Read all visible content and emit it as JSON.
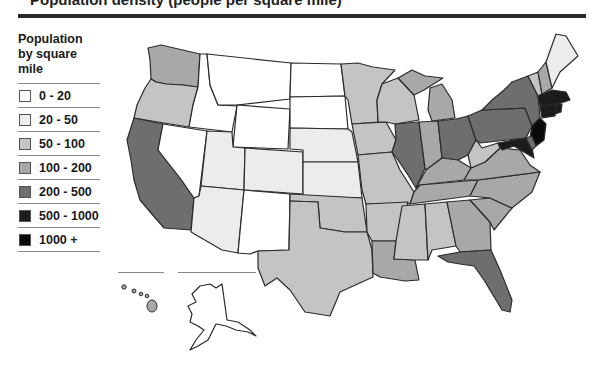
{
  "title_partial": "Population density (people per square mile)",
  "legend": {
    "title": "Population by square mile",
    "items": [
      {
        "label": "0 - 20",
        "color": "#ffffff"
      },
      {
        "label": "20 - 50",
        "color": "#ececec"
      },
      {
        "label": "50 - 100",
        "color": "#c4c4c4"
      },
      {
        "label": "100 - 200",
        "color": "#a8a8a8"
      },
      {
        "label": "200 - 500",
        "color": "#6e6e6e"
      },
      {
        "label": "500 - 1000",
        "color": "#1c1c1c"
      },
      {
        "label": "1000 +",
        "color": "#0a0a0a"
      }
    ]
  },
  "map": {
    "region": "United States",
    "insets": [
      "Hawaii",
      "Alaska"
    ],
    "states": {
      "WA": "100 - 200",
      "OR": "50 - 100",
      "CA": "200 - 500",
      "ID": "0 - 20",
      "NV": "0 - 20",
      "MT": "0 - 20",
      "WY": "0 - 20",
      "UT": "20 - 50",
      "CO": "20 - 50",
      "AZ": "20 - 50",
      "NM": "0 - 20",
      "ND": "0 - 20",
      "SD": "0 - 20",
      "NE": "20 - 50",
      "KS": "20 - 50",
      "OK": "50 - 100",
      "TX": "50 - 100",
      "MN": "50 - 100",
      "IA": "50 - 100",
      "MO": "50 - 100",
      "AR": "50 - 100",
      "LA": "100 - 200",
      "WI": "50 - 100",
      "IL": "200 - 500",
      "MI": "100 - 200",
      "IN": "100 - 200",
      "OH": "200 - 500",
      "KY": "100 - 200",
      "TN": "100 - 200",
      "MS": "50 - 100",
      "AL": "50 - 100",
      "GA": "100 - 200",
      "FL": "200 - 500",
      "SC": "100 - 200",
      "NC": "100 - 200",
      "VA": "100 - 200",
      "WV": "50 - 100",
      "PA": "200 - 500",
      "NY": "200 - 500",
      "VT": "50 - 100",
      "NH": "100 - 200",
      "ME": "20 - 50",
      "MA": "500 - 1000",
      "RI": "500 - 1000",
      "CT": "500 - 1000",
      "NJ": "1000 +",
      "DE": "200 - 500",
      "MD": "500 - 1000",
      "HI": "100 - 200",
      "AK": "0 - 20"
    }
  }
}
